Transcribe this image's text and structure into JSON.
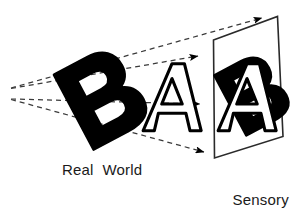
{
  "figure": {
    "kind": "perspective-projection-diagram",
    "width": 300,
    "height": 222,
    "background_color": "#ffffff",
    "ink_color": "#000000",
    "text_color": "#1a1a1a"
  },
  "labels": {
    "real_world": "Real  World",
    "sensory_surface_line1": "Sensory",
    "sensory_surface_line2": "Surface"
  },
  "objects": {
    "letter_b": {
      "glyph": "B",
      "style": "solid-filled",
      "fill_color": "#000000",
      "rotation_deg": -28,
      "center_x": 103,
      "center_y": 95,
      "size": 78
    },
    "letter_a": {
      "glyph": "A",
      "style": "outline",
      "stroke_color": "#000000",
      "fill_color": "#ffffff",
      "rotation_deg": 0,
      "center_x": 172,
      "center_y": 97,
      "size": 72
    },
    "projected_b": {
      "glyph": "B",
      "style": "solid-filled",
      "fill_color": "#000000",
      "rotation_deg": -28,
      "center_x": 251,
      "center_y": 88,
      "size": 72
    },
    "projected_a": {
      "glyph": "A",
      "style": "outline",
      "stroke_color": "#000000",
      "fill_color": "#ffffff",
      "rotation_deg": 0,
      "center_x": 243,
      "center_y": 98,
      "size": 74
    }
  },
  "surface_plane": {
    "name": "sensory-surface-plane",
    "stroke_color": "#2a2a2a",
    "corners": [
      {
        "x": 213.5,
        "y": 40.0
      },
      {
        "x": 277.5,
        "y": 16.5
      },
      {
        "x": 283.0,
        "y": 136.5
      },
      {
        "x": 214.5,
        "y": 158.0
      }
    ]
  },
  "projection_rays": {
    "viewpoint_upper": {
      "x": 11,
      "y": 88
    },
    "viewpoint_lower": {
      "x": 11,
      "y": 99
    },
    "stroke_color": "#3a3a3a",
    "dash_pattern": "5 4",
    "rays": [
      {
        "name": "ray-top-outer",
        "x1": 11,
        "y1": 88,
        "x2": 264,
        "y2": 17,
        "arrow": true
      },
      {
        "name": "ray-top-inner",
        "x1": 11,
        "y1": 88,
        "x2": 200,
        "y2": 56,
        "arrow": true
      },
      {
        "name": "ray-middle",
        "x1": 11,
        "y1": 99,
        "x2": 202,
        "y2": 104,
        "arrow": true
      },
      {
        "name": "ray-bottom",
        "x1": 11,
        "y1": 99,
        "x2": 206,
        "y2": 154,
        "arrow": true
      }
    ]
  }
}
